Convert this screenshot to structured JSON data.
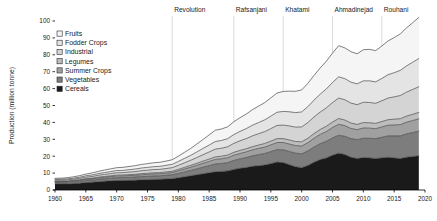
{
  "chart_data": {
    "type": "area",
    "stacked": true,
    "title": "",
    "xlabel": "",
    "ylabel": "Production (million tonne)",
    "xlim": [
      1960,
      2020
    ],
    "ylim": [
      0,
      100
    ],
    "grid": false,
    "legend_position": "top-left",
    "x": [
      1960,
      1961,
      1962,
      1963,
      1964,
      1965,
      1966,
      1967,
      1968,
      1969,
      1970,
      1971,
      1972,
      1973,
      1974,
      1975,
      1976,
      1977,
      1978,
      1979,
      1980,
      1981,
      1982,
      1983,
      1984,
      1985,
      1986,
      1987,
      1988,
      1989,
      1990,
      1991,
      1992,
      1993,
      1994,
      1995,
      1996,
      1997,
      1998,
      1999,
      2000,
      2001,
      2002,
      2003,
      2004,
      2005,
      2006,
      2007,
      2008,
      2009,
      2010,
      2011,
      2012,
      2013,
      2014,
      2015,
      2016,
      2017,
      2018,
      2019
    ],
    "xticks": [
      1960,
      1965,
      1970,
      1975,
      1980,
      1985,
      1990,
      1995,
      2000,
      2005,
      2010,
      2015,
      2020
    ],
    "yticks": [
      0,
      10,
      20,
      30,
      40,
      50,
      60,
      70,
      80,
      90,
      100
    ],
    "series": [
      {
        "name": "Cereals",
        "color": "#1a1a1a",
        "values": [
          3.5,
          3.6,
          3.6,
          3.8,
          4.0,
          4.4,
          4.6,
          4.9,
          5.2,
          5.4,
          5.6,
          5.6,
          5.7,
          5.8,
          6.0,
          6.1,
          6.2,
          6.3,
          6.5,
          6.7,
          7.2,
          7.8,
          8.4,
          9.0,
          9.6,
          10.2,
          10.8,
          11.0,
          11.3,
          12.2,
          12.8,
          13.3,
          14.0,
          14.4,
          14.8,
          15.6,
          16.5,
          16.2,
          15.0,
          13.8,
          13.2,
          14.5,
          16.4,
          18.0,
          19.0,
          20.6,
          21.8,
          21.0,
          19.4,
          18.6,
          19.2,
          19.0,
          18.6,
          19.0,
          19.4,
          19.0,
          18.6,
          19.4,
          19.8,
          20.2
        ]
      },
      {
        "name": "Vegetables",
        "color": "#7d7d7d",
        "values": [
          0.9,
          0.9,
          0.9,
          1.0,
          1.1,
          1.2,
          1.3,
          1.4,
          1.5,
          1.6,
          1.7,
          1.7,
          1.8,
          1.9,
          1.9,
          2.0,
          2.1,
          2.1,
          2.2,
          2.3,
          2.6,
          2.9,
          3.2,
          3.5,
          3.9,
          4.2,
          4.6,
          4.7,
          4.9,
          5.3,
          5.6,
          5.9,
          6.2,
          6.5,
          6.8,
          7.1,
          7.4,
          7.6,
          7.8,
          8.0,
          8.2,
          8.6,
          9.0,
          9.4,
          9.8,
          10.2,
          10.6,
          10.8,
          11.0,
          11.2,
          11.4,
          11.6,
          11.8,
          12.2,
          12.6,
          13.0,
          13.4,
          13.8,
          14.2,
          14.6
        ]
      },
      {
        "name": "Summer Crops",
        "color": "#a0a0a0",
        "values": [
          0.5,
          0.5,
          0.5,
          0.6,
          0.6,
          0.7,
          0.7,
          0.8,
          0.8,
          0.9,
          0.9,
          1.0,
          1.0,
          1.0,
          1.1,
          1.1,
          1.2,
          1.2,
          1.2,
          1.3,
          1.5,
          1.7,
          1.9,
          2.1,
          2.3,
          2.5,
          2.7,
          2.8,
          2.9,
          3.1,
          3.2,
          3.4,
          3.5,
          3.7,
          3.8,
          4.0,
          4.2,
          4.3,
          4.4,
          4.5,
          4.6,
          4.9,
          5.2,
          5.5,
          5.8,
          6.2,
          6.5,
          6.3,
          6.0,
          5.9,
          6.1,
          6.0,
          5.9,
          6.1,
          6.3,
          6.5,
          6.7,
          6.9,
          7.1,
          7.3
        ]
      },
      {
        "name": "Legumes",
        "color": "#bdbdbd",
        "values": [
          0.3,
          0.3,
          0.3,
          0.3,
          0.4,
          0.4,
          0.4,
          0.5,
          0.5,
          0.5,
          0.6,
          0.6,
          0.6,
          0.6,
          0.7,
          0.7,
          0.7,
          0.7,
          0.8,
          0.8,
          0.9,
          1.0,
          1.1,
          1.2,
          1.3,
          1.4,
          1.5,
          1.5,
          1.6,
          1.7,
          1.8,
          1.8,
          1.9,
          2.0,
          2.1,
          2.2,
          2.3,
          2.3,
          2.4,
          2.4,
          2.5,
          2.6,
          2.8,
          2.9,
          3.1,
          3.2,
          3.4,
          3.3,
          3.2,
          3.1,
          3.2,
          3.2,
          3.1,
          3.2,
          3.3,
          3.4,
          3.5,
          3.6,
          3.7,
          3.8
        ]
      },
      {
        "name": "Industrial",
        "color": "#d4d4d4",
        "values": [
          0.6,
          0.6,
          0.7,
          0.7,
          0.8,
          0.9,
          1.0,
          1.1,
          1.2,
          1.3,
          1.4,
          1.4,
          1.5,
          1.6,
          1.7,
          1.8,
          1.9,
          1.9,
          2.0,
          2.1,
          2.4,
          2.7,
          3.0,
          3.4,
          3.8,
          4.2,
          4.6,
          4.7,
          4.9,
          5.3,
          5.7,
          6.0,
          6.4,
          6.7,
          7.0,
          7.4,
          7.8,
          8.0,
          8.3,
          8.5,
          8.8,
          9.3,
          9.8,
          10.3,
          10.9,
          11.5,
          12.1,
          12.0,
          11.8,
          11.7,
          12.0,
          12.0,
          11.9,
          12.3,
          12.8,
          13.2,
          13.7,
          14.2,
          14.7,
          15.2
        ]
      },
      {
        "name": "Fodder Crops",
        "color": "#e4e4e4",
        "values": [
          0.5,
          0.5,
          0.6,
          0.6,
          0.7,
          0.8,
          0.9,
          1.0,
          1.1,
          1.2,
          1.3,
          1.3,
          1.4,
          1.5,
          1.6,
          1.7,
          1.7,
          1.8,
          1.9,
          2.0,
          2.3,
          2.6,
          2.9,
          3.3,
          3.7,
          4.1,
          4.5,
          4.6,
          4.8,
          5.2,
          5.6,
          5.9,
          6.3,
          6.6,
          7.0,
          7.4,
          7.8,
          8.1,
          8.4,
          8.6,
          8.9,
          9.4,
          10.0,
          10.6,
          11.2,
          11.9,
          12.6,
          12.5,
          12.4,
          12.3,
          12.7,
          12.8,
          12.7,
          13.2,
          13.8,
          14.3,
          14.9,
          15.5,
          16.1,
          16.7
        ]
      },
      {
        "name": "Fruits",
        "color": "#f5f5f5",
        "values": [
          0.6,
          0.6,
          0.7,
          0.8,
          0.9,
          1.0,
          1.2,
          1.3,
          1.5,
          1.6,
          1.7,
          1.8,
          1.9,
          2.0,
          2.1,
          2.2,
          2.3,
          2.4,
          2.5,
          2.7,
          3.1,
          3.6,
          4.1,
          4.7,
          5.3,
          6.0,
          6.7,
          6.8,
          7.0,
          7.6,
          8.1,
          8.6,
          9.2,
          9.7,
          10.2,
          10.8,
          11.4,
          11.8,
          12.2,
          12.6,
          13.0,
          13.8,
          14.6,
          15.5,
          16.4,
          17.4,
          18.4,
          18.2,
          18.0,
          17.8,
          18.4,
          18.6,
          18.5,
          19.2,
          20.0,
          20.8,
          21.6,
          22.5,
          23.4,
          24.3
        ]
      }
    ],
    "era_markers": [
      {
        "label": "Revolution",
        "year": 1979
      },
      {
        "label": "Rafsanjani",
        "year": 1989
      },
      {
        "label": "Khatami",
        "year": 1997
      },
      {
        "label": "Ahmadinejad",
        "year": 2005
      },
      {
        "label": "Rouhani",
        "year": 2013
      }
    ],
    "legend_order": [
      "Fruits",
      "Fodder Crops",
      "Industrial",
      "Legumes",
      "Summer Crops",
      "Vegetables",
      "Cereals"
    ]
  }
}
